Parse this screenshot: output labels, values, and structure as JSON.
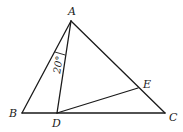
{
  "diagram": {
    "type": "geometry-triangle",
    "points": {
      "A": {
        "label": "A",
        "x": 71,
        "y": 21
      },
      "B": {
        "label": "B",
        "x": 22,
        "y": 113
      },
      "C": {
        "label": "C",
        "x": 165,
        "y": 113
      },
      "D": {
        "label": "D",
        "x": 57,
        "y": 113
      },
      "E": {
        "label": "E",
        "x": 138,
        "y": 88
      }
    },
    "segments": [
      "AB",
      "AC",
      "BC",
      "AD",
      "DE"
    ],
    "angle_marks": [
      {
        "at": "A",
        "between": [
          "AB",
          "AD"
        ],
        "label": "20°"
      }
    ],
    "colors": {
      "stroke": "#1a1a1a",
      "background": "#ffffff"
    }
  }
}
